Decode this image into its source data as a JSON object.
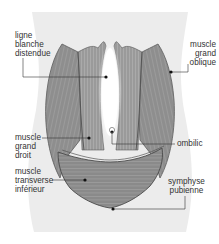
{
  "diagram": {
    "colors": {
      "background": "#ffffff",
      "body_silhouette": "#ececec",
      "muscle": "#8c8c8c",
      "muscle_dark": "#6f6f6f",
      "muscle_light": "#b5b5b5",
      "outline": "#4a4a4a",
      "leader_line": "#333333",
      "label_text": "#333333"
    },
    "labels": [
      {
        "id": "ligne-blanche",
        "text": "ligne\nblanche\ndistendue"
      },
      {
        "id": "grand-oblique",
        "text": "muscle\ngrand\noblique"
      },
      {
        "id": "grand-droit",
        "text": "muscle\ngrand\ndroit"
      },
      {
        "id": "ombilic",
        "text": "ombilic"
      },
      {
        "id": "transverse",
        "text": "muscle\ntransverse\ninférieur"
      },
      {
        "id": "symphyse",
        "text": "symphyse\npubienne"
      }
    ]
  }
}
